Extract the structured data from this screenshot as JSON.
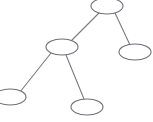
{
  "canvas": {
    "width": 153,
    "height": 122,
    "background": "#ffffff",
    "title": "node-link tree diagram"
  },
  "style": {
    "node_stroke": "#6f6f76",
    "node_fill": "#ffffff",
    "edge_stroke": "#7a7a80",
    "node_stroke_width": 1.1,
    "edge_stroke_width": 1.1,
    "node_rx": 16,
    "node_ry": 8
  },
  "graph": {
    "type": "tree",
    "node_shape": "ellipse",
    "node_count": 5,
    "edge_count": 4,
    "nodes": [
      {
        "id": "root",
        "label": "",
        "cx": 107,
        "cy": 6,
        "rx": 16,
        "ry": 8,
        "role": "root"
      },
      {
        "id": "branch",
        "label": "",
        "cx": 62,
        "cy": 47,
        "rx": 16,
        "ry": 8,
        "role": "internal"
      },
      {
        "id": "leaf-right",
        "label": "",
        "cx": 135,
        "cy": 52,
        "rx": 16,
        "ry": 8,
        "role": "leaf"
      },
      {
        "id": "leaf-bottom-left",
        "label": "",
        "cx": 10,
        "cy": 97,
        "rx": 16,
        "ry": 8,
        "role": "leaf"
      },
      {
        "id": "leaf-bottom-middle",
        "label": "",
        "cx": 87,
        "cy": 107,
        "rx": 16,
        "ry": 8,
        "role": "leaf"
      }
    ],
    "edges": [
      {
        "id": "edge-root-branch",
        "from": "root",
        "to": "branch",
        "x1": 99,
        "y1": 13,
        "x2": 71,
        "y2": 41
      },
      {
        "id": "edge-root-leaf-right",
        "from": "root",
        "to": "leaf-right",
        "x1": 115,
        "y1": 13,
        "x2": 130,
        "y2": 45
      },
      {
        "id": "edge-branch-leaf-left",
        "from": "branch",
        "to": "leaf-bottom-left",
        "x1": 51,
        "y1": 53,
        "x2": 20,
        "y2": 92
      },
      {
        "id": "edge-branch-leaf-mid",
        "from": "branch",
        "to": "leaf-bottom-middle",
        "x1": 66,
        "y1": 55,
        "x2": 84,
        "y2": 99
      }
    ]
  }
}
